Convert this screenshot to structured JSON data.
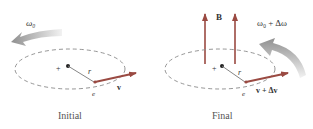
{
  "panels": [
    {
      "id": "initial",
      "caption": "Initial",
      "omega_label": "ω₀",
      "radius_label": "r",
      "charge_label": "e",
      "velocity_label": "v",
      "center_mark": "+"
    },
    {
      "id": "final",
      "caption": "Final",
      "field_label": "B",
      "omega_label": "ω₀ + Δω",
      "radius_label": "r",
      "charge_label": "e",
      "velocity_label": "v + Δv",
      "center_mark": "+"
    }
  ],
  "colors": {
    "arrow_red": "#9a4a42",
    "orbit_dash": "#8a8a8a",
    "radius_line": "#777777",
    "text": "#333333",
    "rotation_arrow_dark": "#9a9a9a",
    "rotation_arrow_light": "#eeeeee"
  }
}
